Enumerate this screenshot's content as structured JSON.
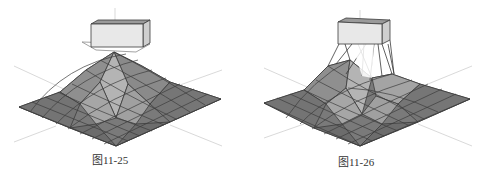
{
  "figures": [
    {
      "id": "left",
      "caption": "图11-25",
      "description": "Box above a smooth gaussian-shaped mesh surface with an intersection plane",
      "colors": {
        "mesh_dark": "#6e6e6e",
        "mesh_mid": "#8c8c8c",
        "mesh_light": "#b0b0b0",
        "box_face": "#e6e6e6",
        "box_top": "#9a9a9a",
        "axis": "#c8c8c8"
      }
    },
    {
      "id": "right",
      "caption": "图11-26",
      "description": "Box connected by extruded faces down to a mesh surface",
      "colors": {
        "mesh_dark": "#6e6e6e",
        "mesh_mid": "#8c8c8c",
        "mesh_light": "#b0b0b0",
        "box_face": "#e6e6e6",
        "box_top": "#9a9a9a",
        "axis": "#c8c8c8"
      }
    }
  ]
}
